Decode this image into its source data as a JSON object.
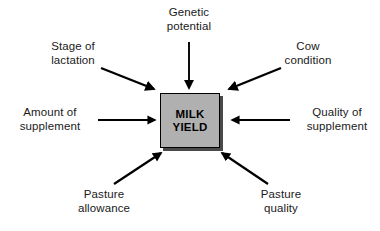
{
  "diagram": {
    "type": "influence-diagram",
    "center": {
      "line1": "MILK",
      "line2": "YIELD",
      "fill_color": "#b0b0b0",
      "border_color": "#000000",
      "shadow_color": "#4a4a4a"
    },
    "factors": [
      {
        "id": "stage-of-lactation",
        "line1": "Stage of",
        "line2": "lactation",
        "position": "top-left",
        "arrow_direction": "down-right"
      },
      {
        "id": "genetic-potential",
        "line1": "Genetic",
        "line2": "potential",
        "position": "top-center",
        "arrow_direction": "down"
      },
      {
        "id": "cow-condition",
        "line1": "Cow",
        "line2": "condition",
        "position": "top-right",
        "arrow_direction": "down-left"
      },
      {
        "id": "amount-of-supplement",
        "line1": "Amount of",
        "line2": "supplement",
        "position": "middle-left",
        "arrow_direction": "right"
      },
      {
        "id": "quality-of-supplement",
        "line1": "Quality of",
        "line2": "supplement",
        "position": "middle-right",
        "arrow_direction": "left"
      },
      {
        "id": "pasture-allowance",
        "line1": "Pasture",
        "line2": "allowance",
        "position": "bottom-left",
        "arrow_direction": "up-right"
      },
      {
        "id": "pasture-quality",
        "line1": "Pasture",
        "line2": "quality",
        "position": "bottom-right",
        "arrow_direction": "up-left"
      }
    ],
    "arrow_color": "#000000",
    "background_color": "#ffffff"
  }
}
